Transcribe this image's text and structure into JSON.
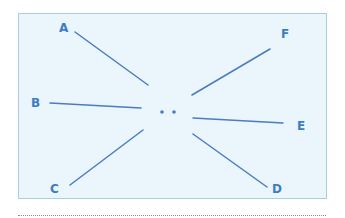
{
  "diagram": {
    "background_color": "#eaf6fb",
    "border_color": "#a9cde3",
    "line_color": "#4a7cbf",
    "label_color": "#3b7cc4",
    "labels": {
      "A": "A",
      "B": "B",
      "C": "C",
      "D": "D",
      "E": "E",
      "F": "F"
    },
    "center": "two dots (eyes)",
    "rays": [
      {
        "label": "A",
        "from": [
          75,
          32
        ],
        "to": [
          148,
          85
        ]
      },
      {
        "label": "B",
        "from": [
          50,
          103
        ],
        "to": [
          141,
          108
        ]
      },
      {
        "label": "C",
        "from": [
          70,
          185
        ],
        "to": [
          143,
          130
        ]
      },
      {
        "label": "D",
        "from": [
          267,
          187
        ],
        "to": [
          193,
          134
        ]
      },
      {
        "label": "E",
        "from": [
          283,
          123
        ],
        "to": [
          193,
          118
        ]
      },
      {
        "label": "F",
        "from": [
          270,
          49
        ],
        "to": [
          192,
          95
        ]
      }
    ]
  }
}
